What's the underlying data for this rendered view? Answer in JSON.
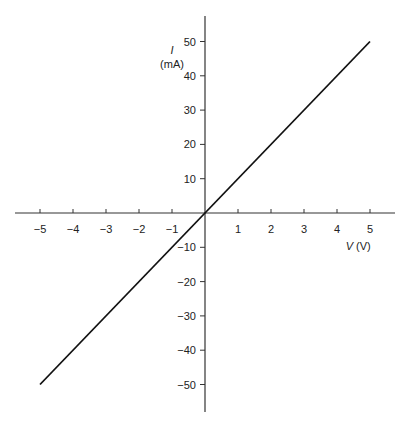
{
  "chart_data": {
    "type": "line",
    "title": "",
    "xlabel": "V (V)",
    "xlabel_var": "V",
    "xlabel_unit": "(V)",
    "ylabel": "I (mA)",
    "ylabel_var": "I",
    "ylabel_unit": "(mA)",
    "xlim": [
      -5,
      5
    ],
    "ylim": [
      -50,
      50
    ],
    "x_ticks": [
      -5,
      -4,
      -3,
      -2,
      -1,
      1,
      2,
      3,
      4,
      5
    ],
    "y_ticks": [
      50,
      40,
      30,
      20,
      10,
      -10,
      -20,
      -30,
      -40,
      -50
    ],
    "grid": false,
    "legend": null,
    "series": [
      {
        "name": "I-V line",
        "x": [
          -5,
          0,
          5
        ],
        "y": [
          -50,
          0,
          50
        ],
        "color": "#111111"
      }
    ]
  }
}
